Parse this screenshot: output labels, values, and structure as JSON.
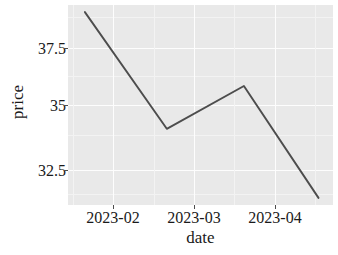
{
  "chart_data": {
    "type": "line",
    "title": "",
    "xlabel": "date",
    "ylabel": "price",
    "grid": true,
    "legend": "none",
    "x_tick_labels": [
      "2023-02",
      "2023-03",
      "2023-04"
    ],
    "y_tick_labels": [
      "37.5",
      "35",
      "32.5"
    ],
    "y_ticks": [
      37.5,
      35,
      32.5
    ],
    "ylim": [
      30.8,
      39.2
    ],
    "xlim": [
      "2023-01-18",
      "2023-05-08"
    ],
    "series": [
      {
        "name": "price",
        "color": "#4d4d4d",
        "x": [
          "2023-01-25",
          "2023-02-28",
          "2023-04-01",
          "2023-05-02"
        ],
        "values": [
          38.9,
          34.0,
          35.8,
          31.1
        ]
      }
    ]
  },
  "axes": {
    "y_title": "price",
    "x_title": "date",
    "y_labels": [
      {
        "text": "37.5",
        "value": 37.5
      },
      {
        "text": "35",
        "value": 35
      },
      {
        "text": "32.5",
        "value": 32.5
      }
    ],
    "x_labels": [
      {
        "text": "2023-02"
      },
      {
        "text": "2023-03"
      },
      {
        "text": "2023-04"
      }
    ]
  },
  "style": {
    "panel_background": "#e9e9e9",
    "grid_major_color": "#fdfdfd",
    "grid_minor_color": "#f3f3f3",
    "line_color": "#4d4d4d",
    "text_color": "#1a1a1a",
    "page_background": "#ffffff"
  }
}
